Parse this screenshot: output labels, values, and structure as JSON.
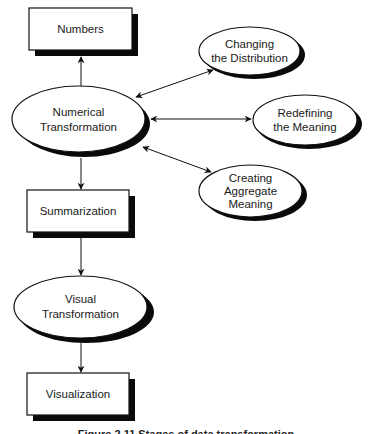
{
  "diagram": {
    "nodes": {
      "numbers": {
        "label": "Numbers",
        "shape": "rectangle"
      },
      "numerical_transformation": {
        "line1": "Numerical",
        "line2": "Transformation",
        "shape": "ellipse"
      },
      "changing_distribution": {
        "line1": "Changing",
        "line2": "the Distribution",
        "shape": "ellipse"
      },
      "redefining_meaning": {
        "line1": "Redefining",
        "line2": "the Meaning",
        "shape": "ellipse"
      },
      "creating_aggregate": {
        "line1": "Creating",
        "line2": "Aggregate",
        "line3": "Meaning",
        "shape": "ellipse"
      },
      "summarization": {
        "label": "Summarization",
        "shape": "rectangle"
      },
      "visual_transformation": {
        "line1": "Visual",
        "line2": "Transformation",
        "shape": "ellipse"
      },
      "visualization": {
        "label": "Visualization",
        "shape": "rectangle"
      }
    },
    "edges": [
      {
        "from": "numerical_transformation",
        "to": "numbers",
        "direction": "forward"
      },
      {
        "from": "numerical_transformation",
        "to": "changing_distribution",
        "direction": "both"
      },
      {
        "from": "numerical_transformation",
        "to": "redefining_meaning",
        "direction": "both"
      },
      {
        "from": "numerical_transformation",
        "to": "creating_aggregate",
        "direction": "both"
      },
      {
        "from": "numerical_transformation",
        "to": "summarization",
        "direction": "forward"
      },
      {
        "from": "summarization",
        "to": "visual_transformation",
        "direction": "forward"
      },
      {
        "from": "visual_transformation",
        "to": "visualization",
        "direction": "forward"
      }
    ],
    "colors": {
      "stroke": "#111111",
      "fill": "#ffffff",
      "shadow": "#0a0a0a"
    }
  },
  "caption": {
    "text": "Figure 2.11  Stages of data transformation"
  }
}
